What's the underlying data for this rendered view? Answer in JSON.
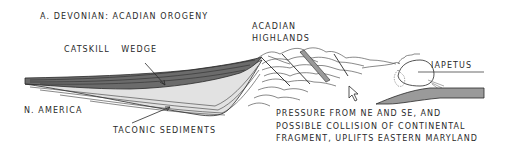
{
  "title": "A. DEVONIAN: ACADIAN OROGENY",
  "labels": {
    "catskill_wedge": "CATSKILL WEDGE",
    "acadian_highlands_line1": "ACADIAN",
    "acadian_highlands_line2": "HIGHLANDS",
    "iapetus": "IAPETUS",
    "north_america": "N. AMERICA",
    "taconic_sediments": "TACONIC SEDIMENTS"
  },
  "note": {
    "lines": [
      "PRESSURE FROM NE AND SE, AND",
      "POSSIBLE COLLISION OF CONTINENTAL",
      "FRAGMENT, UPLIFTS EASTERN MARYLAND"
    ]
  },
  "colors": {
    "catskill_fill": "#6b6b6b",
    "taconic_fill": "#e2e2e2",
    "ocean_plate_fill": "#9a9a9a",
    "ink": "#2a2a2a"
  }
}
